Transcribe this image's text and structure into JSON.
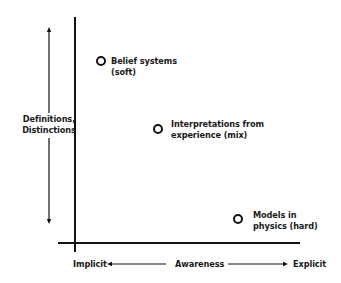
{
  "diagram": {
    "type": "2d-quadrant-plot",
    "y_axis": {
      "label_line1": "Definitions,",
      "label_line2": "Distinctions",
      "direction": "bidirectional"
    },
    "x_axis": {
      "left_label": "Implicit",
      "center_label": "Awareness",
      "right_label": "Explicit",
      "direction": "bidirectional"
    },
    "points": [
      {
        "line1": "Belief systems",
        "line2": "(soft)"
      },
      {
        "line1": "Interpretations from",
        "line2": "experience (mix)"
      },
      {
        "line1": "Models in",
        "line2": "physics (hard)"
      }
    ],
    "colors": {
      "line": "#111111",
      "background": "#ffffff",
      "text": "#1a1a1a"
    }
  }
}
